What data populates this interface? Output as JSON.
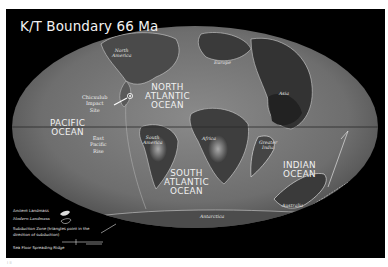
{
  "title": "K/T Boundary 66 Ma",
  "oceans": {
    "pacific": "PACIFIC\nOCEAN",
    "north_atlantic": "NORTH\nATLANTIC\nOCEAN",
    "south_atlantic": "SOUTH\nATLANTIC\nOCEAN",
    "indian": "INDIAN\nOCEAN"
  },
  "landmasses": {
    "north_america": "North\nAmerica",
    "europe": "Europe",
    "asia": "Asia",
    "south_america": "South\nAmerica",
    "africa": "Africa",
    "greater_india": "Greater\nIndia",
    "australia": "Australia",
    "antarctica": "Antarctica"
  },
  "features": {
    "chicxulub": "Chicxulub\nImpact\nSite",
    "east_pacific_rise": "East\nPacific\nRise"
  },
  "legend": {
    "ancient_landmass": "Ancient Landmass",
    "modern_landmass": "Modern Landmass",
    "subduction_zone_line1": "Subduction Zone (triangles point in the",
    "subduction_zone_line2": "direction of subduction)",
    "sea_floor_spreading": "Sea Floor Spreading Ridge"
  },
  "footnote": "i ii",
  "colors": {
    "background": "#000000",
    "ocean": "#7a7a7a",
    "land_dark": "#3a3a3a",
    "land_light": "#b8b8b8",
    "text": "#f0f0f0"
  }
}
